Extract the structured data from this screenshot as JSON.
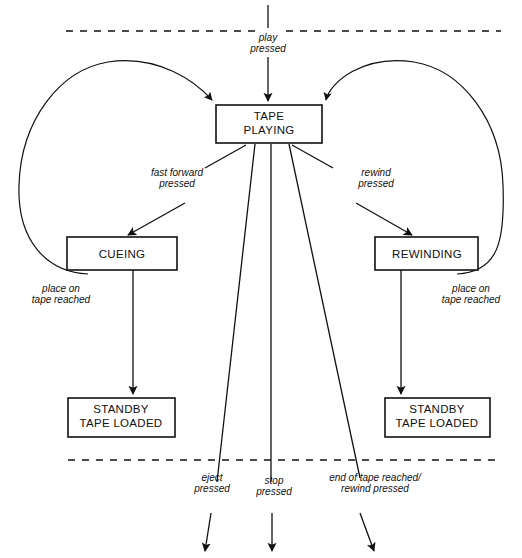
{
  "diagram": {
    "colors": {
      "stroke": "#111111",
      "background": "#ffffff"
    },
    "states": [
      {
        "id": "tape-playing",
        "line1": "TAPE",
        "line2": "PLAYING"
      },
      {
        "id": "cueing",
        "line1": "CUEING",
        "line2": ""
      },
      {
        "id": "rewinding",
        "line1": "REWINDING",
        "line2": ""
      },
      {
        "id": "standby-left",
        "line1": "STANDBY",
        "line2": "TAPE LOADED"
      },
      {
        "id": "standby-right",
        "line1": "STANDBY",
        "line2": "TAPE LOADED"
      }
    ],
    "transitions": [
      {
        "id": "play",
        "line1": "play",
        "line2": "pressed"
      },
      {
        "id": "fast-forward",
        "line1": "fast forward",
        "line2": "pressed"
      },
      {
        "id": "rewind",
        "line1": "rewind",
        "line2": "pressed"
      },
      {
        "id": "place-on-left",
        "line1": "place on",
        "line2": "tape reached"
      },
      {
        "id": "place-on-right",
        "line1": "place on",
        "line2": "tape reached"
      },
      {
        "id": "eject",
        "line1": "eject",
        "line2": "pressed"
      },
      {
        "id": "stop",
        "line1": "stop",
        "line2": "pressed"
      },
      {
        "id": "end-of-tape",
        "line1": "end of tape reached/",
        "line2": "rewind pressed"
      }
    ]
  }
}
